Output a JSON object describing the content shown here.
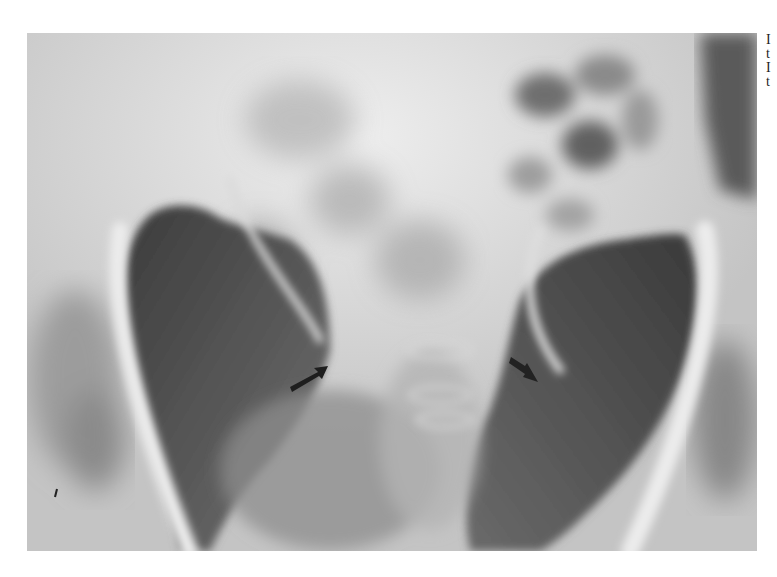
{
  "figure": {
    "type": "pelvic radiograph",
    "palette": {
      "background": "#ffffff",
      "bone_light": "#e6e6e6",
      "soft_tissue": "#b8b8b8",
      "mid_gray": "#9a9a9a",
      "dark_air": "#4a4a4a",
      "arrow": "#1e1e1e"
    },
    "annotations": [
      {
        "name": "left-arrow",
        "pointing": "up-right",
        "x": 310,
        "y": 375
      },
      {
        "name": "right-arrow",
        "pointing": "down-right",
        "x": 525,
        "y": 372
      }
    ]
  },
  "caption": {
    "lines": [
      "I",
      "t",
      "I",
      "t"
    ]
  }
}
